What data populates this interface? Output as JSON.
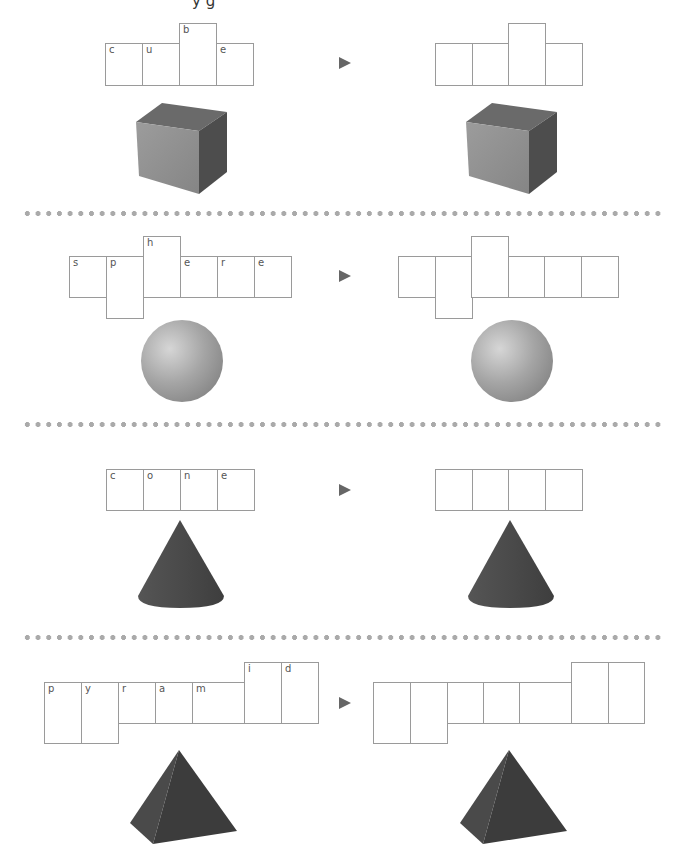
{
  "title_fragment": "y g",
  "arrow_symbol": "►",
  "colors": {
    "box_border": "#9a9a9a",
    "letter": "#555555",
    "arrow": "#666666",
    "divider_dot": "#aaaaaa",
    "shape_dark": "#444444"
  },
  "rows": [
    {
      "shape": "cube",
      "word": "cube",
      "letters": [
        "c",
        "u",
        "b",
        "e"
      ]
    },
    {
      "shape": "sphere",
      "word": "sphere",
      "letters": [
        "s",
        "p",
        "h",
        "e",
        "r",
        "e"
      ]
    },
    {
      "shape": "cone",
      "word": "cone",
      "letters": [
        "c",
        "o",
        "n",
        "e"
      ]
    },
    {
      "shape": "pyramid",
      "word": "pyramid",
      "letters": [
        "p",
        "y",
        "r",
        "a",
        "m",
        "i",
        "d"
      ]
    }
  ]
}
